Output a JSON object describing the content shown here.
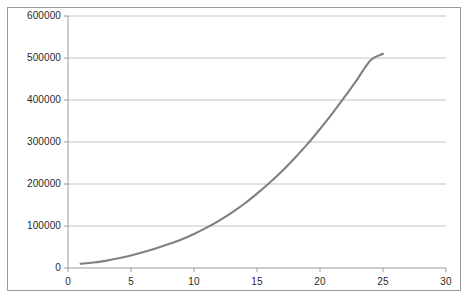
{
  "chart_data": {
    "type": "line",
    "title": "",
    "xlabel": "",
    "ylabel": "",
    "xlim": [
      0,
      30
    ],
    "ylim": [
      0,
      600000
    ],
    "grid": "horizontal",
    "legend": "none",
    "line_color": "#808080",
    "axis_color": "#9a9a9a",
    "grid_color": "#b5b5b5",
    "text_color": "#2b2b2b",
    "x_ticks": [
      "0",
      "5",
      "10",
      "15",
      "20",
      "25",
      "30"
    ],
    "x_tick_values": [
      0,
      5,
      10,
      15,
      20,
      25,
      30
    ],
    "y_ticks": [
      "0",
      "100000",
      "200000",
      "300000",
      "400000",
      "500000",
      "600000"
    ],
    "y_tick_values": [
      0,
      100000,
      200000,
      300000,
      400000,
      500000,
      600000
    ],
    "series": [
      {
        "name": "series-1",
        "x": [
          1,
          2,
          3,
          4,
          5,
          6,
          7,
          8,
          9,
          10,
          11,
          12,
          13,
          14,
          15,
          16,
          17,
          18,
          19,
          20,
          21,
          22,
          23,
          24,
          25
        ],
        "values": [
          10000,
          13000,
          17000,
          23000,
          30000,
          38000,
          47000,
          57000,
          68000,
          81000,
          96000,
          113000,
          132000,
          153000,
          177000,
          203000,
          231000,
          262000,
          295000,
          331000,
          369000,
          409000,
          451000,
          494000,
          510000
        ]
      }
    ]
  },
  "geometry": {
    "plot_left": 60,
    "plot_right": 438,
    "plot_top": 8,
    "plot_bottom": 260
  }
}
